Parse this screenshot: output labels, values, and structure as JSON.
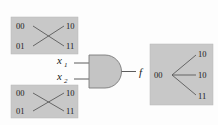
{
  "figure": {
    "background_color": "#fdfdfd",
    "box_fill_color": "#c8c8c8",
    "gate_fill_color": "#c4c4c4",
    "line_color": "#5a5a5a"
  },
  "boxes": {
    "top_left": {
      "name": "top-left-state-box",
      "left_labels": [
        "00",
        "01"
      ],
      "right_labels": [
        "10",
        "11"
      ],
      "pattern": "cross"
    },
    "bottom_left": {
      "name": "bottom-left-state-box",
      "left_labels": [
        "00",
        "01"
      ],
      "right_labels": [
        "10",
        "11"
      ],
      "pattern": "cross"
    },
    "right": {
      "name": "right-state-box",
      "left_labels": [
        "00"
      ],
      "right_labels": [
        "10",
        "10",
        "11"
      ],
      "pattern": "fan"
    }
  },
  "gate": {
    "type": "AND",
    "inputs": [
      {
        "base": "x",
        "subscript": "1"
      },
      {
        "base": "x",
        "subscript": "2"
      }
    ],
    "output": {
      "base": "f",
      "subscript": ""
    }
  }
}
